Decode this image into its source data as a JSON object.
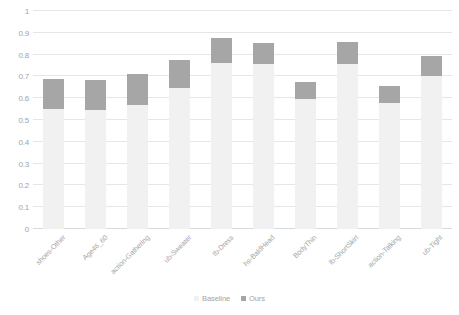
{
  "chart_data": {
    "type": "bar",
    "title": "",
    "subtitle": "",
    "xlabel": "",
    "ylabel": "",
    "ylim": [
      0,
      1
    ],
    "yticks": [
      0,
      0.1,
      0.2,
      0.3,
      0.4,
      0.5,
      0.6,
      0.7,
      0.8,
      0.9,
      1
    ],
    "ytick_labels": [
      "0",
      "0.1",
      "0.2",
      "0.3",
      "0.4",
      "0.5",
      "0.6",
      "0.7",
      "0.8",
      "0.9",
      "1"
    ],
    "grid": true,
    "stacked": true,
    "legend_position": "bottom",
    "categories": [
      "shoes-Other",
      "Age46_60",
      "action-Gathering",
      "ub-Sweater",
      "tb-Dress",
      "hs-BaldHead",
      "BodyThin",
      "lb-ShortSkirt",
      "action-Talking",
      "ub-Tight"
    ],
    "series": [
      {
        "name": "Baseline",
        "color": "#f1f1f1",
        "values": [
          0.55,
          0.545,
          0.57,
          0.645,
          0.76,
          0.755,
          0.595,
          0.755,
          0.58,
          0.7
        ]
      },
      {
        "name": "Ours",
        "color": "#a6a6a6",
        "values": [
          0.69,
          0.685,
          0.71,
          0.775,
          0.875,
          0.855,
          0.675,
          0.86,
          0.655,
          0.795
        ]
      }
    ]
  },
  "legend": {
    "items": [
      {
        "label": "Baseline",
        "color": "#f1f1f1"
      },
      {
        "label": "Ours",
        "color": "#a6a6a6"
      }
    ]
  },
  "colors": {
    "baseline": "#f1f1f1",
    "ours": "#a6a6a6",
    "gridline": "#e3e7ea",
    "axis_text": "#9fa3a6",
    "background": "#ffffff"
  }
}
